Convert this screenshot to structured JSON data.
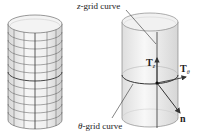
{
  "figure": {
    "left_cylinder": {
      "description": "cylinder with coordinate grid",
      "horizontal_grid_lines": 11,
      "vertical_grid_lines": 5
    },
    "right_cylinder": {
      "labels": {
        "z_grid_curve_var": "z",
        "z_grid_curve_text": "-grid curve",
        "theta_grid_curve_var": "θ",
        "theta_grid_curve_text": "-grid curve",
        "Tz_main": "T",
        "Tz_sub": "z",
        "Ttheta_main": "T",
        "Ttheta_sub": "θ",
        "normal": "n"
      }
    },
    "colors": {
      "stroke": "#333333",
      "fill": "#ececec",
      "fill_light": "#f6f6f6"
    }
  }
}
